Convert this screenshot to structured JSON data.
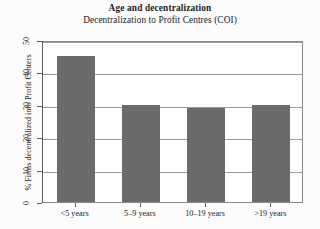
{
  "chart_data": {
    "type": "bar",
    "title": "Age and decentralization",
    "subtitle": "Decentralization to Profit Centres (COI)",
    "xlabel": "",
    "ylabel": "% Firms decentralized into Profit Centers",
    "categories": [
      "<5 years",
      "5–9 years",
      "10–19 years",
      ">19 years"
    ],
    "values": [
      45,
      30,
      29,
      30
    ],
    "ylim": [
      0,
      50
    ],
    "yticks": [
      0,
      10,
      20,
      30,
      40,
      50
    ],
    "ytick_labels": [
      "0",
      "10",
      "20",
      "30",
      "40",
      "50"
    ],
    "grid": true,
    "legend": "none",
    "bar_color": "#6b6b6b",
    "frame_color": "#8a8a8a",
    "grid_color": "#9a9a9a",
    "background_color": "#ffffff"
  }
}
